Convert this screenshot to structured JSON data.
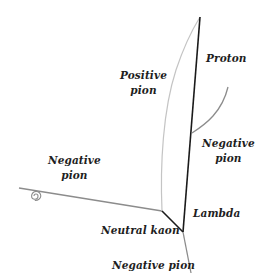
{
  "diagram": {
    "title": "",
    "labels": {
      "proton": "Proton",
      "positive_pion_line1": "Positive",
      "positive_pion_line2": "pion",
      "negative_pion_right_line1": "Negative",
      "negative_pion_right_line2": "pion",
      "negative_pion_left_line1": "Negative",
      "negative_pion_left_line2": "pion",
      "lambda": "Lambda",
      "neutral_kaon": "Neutral kaon",
      "negative_pion_bottom": "Negative pion"
    },
    "colors": {
      "background": "#ffffff",
      "dark_track": "#1a1a1a",
      "medium_track": "#8c8c8c",
      "light_track": "#c4c4c4",
      "text": "#1e1e1e"
    },
    "vertices": {
      "kaon_decay": [
        162,
        211
      ],
      "lambda_decay": [
        183,
        232
      ],
      "proton_end": [
        200,
        17
      ],
      "pion_branch": [
        192,
        133
      ]
    }
  }
}
